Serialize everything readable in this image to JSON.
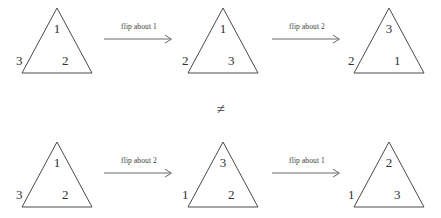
{
  "figure": {
    "relation_symbol": "≠",
    "stroke_color": "#4a4a4a",
    "text_color": "#303030",
    "background": "#ffffff"
  },
  "rows": [
    {
      "id": "top",
      "triangles": [
        {
          "apex": "1",
          "left": "3",
          "right": "2"
        },
        {
          "apex": "1",
          "left": "2",
          "right": "3"
        },
        {
          "apex": "3",
          "left": "2",
          "right": "1"
        }
      ],
      "arrows": [
        {
          "label": "flip about 1"
        },
        {
          "label": "flip about 2"
        }
      ]
    },
    {
      "id": "bottom",
      "triangles": [
        {
          "apex": "1",
          "left": "3",
          "right": "2"
        },
        {
          "apex": "3",
          "left": "1",
          "right": "2"
        },
        {
          "apex": "2",
          "left": "1",
          "right": "3"
        }
      ],
      "arrows": [
        {
          "label": "flip about 2"
        },
        {
          "label": "flip about 1"
        }
      ]
    }
  ]
}
